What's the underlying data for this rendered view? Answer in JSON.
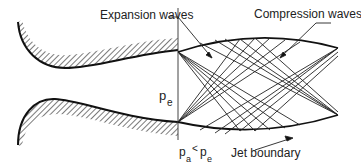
{
  "diagram": {
    "labels": {
      "expansion_waves": "Expansion waves",
      "compression_waves": "Compression waves",
      "exit_pressure_p": "p",
      "exit_pressure_sub": "e",
      "ambient_p": "p",
      "ambient_sub": "a",
      "less_than": "<",
      "exit_p2": "p",
      "exit_p2_sub": "e",
      "jet_boundary": "Jet boundary"
    },
    "colors": {
      "line": "#111111",
      "hatch": "#333333",
      "text": "#222222",
      "background": "#ffffff"
    }
  }
}
